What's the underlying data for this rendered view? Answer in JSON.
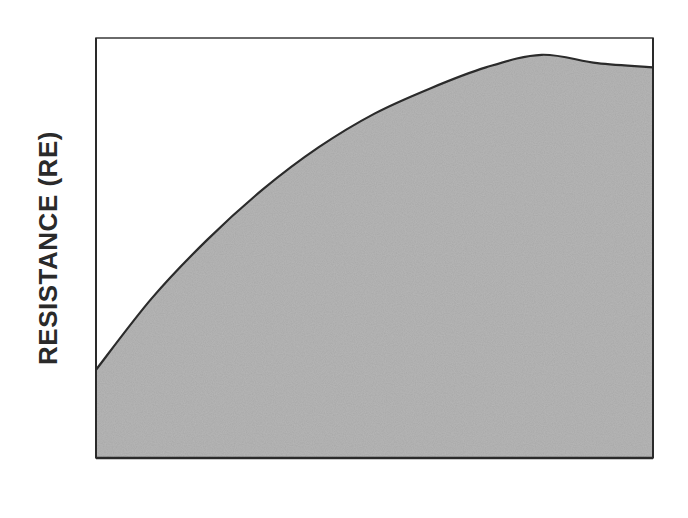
{
  "chart_data": {
    "type": "area",
    "title": "",
    "xlabel": "",
    "ylabel": "RESISTANCE (RE)",
    "x": [
      0,
      10,
      20,
      30,
      40,
      50,
      60,
      70,
      80,
      90,
      100
    ],
    "values": [
      21,
      38,
      52,
      64,
      74,
      82,
      88,
      93,
      96,
      94,
      93
    ],
    "series": [
      {
        "name": "Resistance",
        "values": [
          21,
          38,
          52,
          64,
          74,
          82,
          88,
          93,
          96,
          94,
          93
        ]
      }
    ],
    "ylim": [
      0,
      100
    ],
    "xlim": [
      0,
      100
    ],
    "grid": false,
    "legend": null,
    "note": "No ticks or numeric labels are shown; values are normalized estimates (0–100) read from the curve's pixel positions.",
    "colors": {
      "fill": "#a9a9a9",
      "line": "#2b2b2b",
      "frame": "#3a3a3a"
    }
  }
}
